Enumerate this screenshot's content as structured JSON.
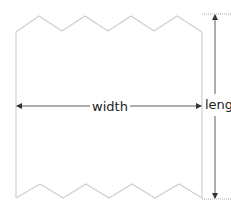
{
  "diagram": {
    "type": "dimensioned-sheet-with-torn-edges",
    "labels": {
      "width": "width",
      "length": "length"
    },
    "colors": {
      "outline": "#cfcfcf",
      "dimension_line": "#333333",
      "extension_line": "#999999",
      "text": "#222222",
      "background": "#ffffff"
    }
  }
}
